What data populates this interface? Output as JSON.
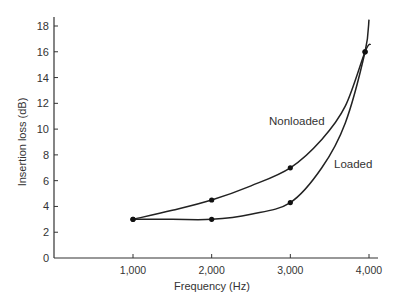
{
  "chart_data": {
    "type": "line",
    "title": "",
    "xlabel": "Frequency (Hz)",
    "ylabel": "Insertion loss (dB)",
    "xlim": [
      0,
      4200
    ],
    "ylim": [
      0,
      18.5
    ],
    "x_ticks": [
      1000,
      2000,
      3000,
      4000
    ],
    "x_tick_labels": [
      "1,000",
      "2,000",
      "3,000",
      "4,000"
    ],
    "y_ticks": [
      0,
      2,
      4,
      6,
      8,
      10,
      12,
      14,
      16,
      18
    ],
    "y_tick_labels": [
      "0",
      "2",
      "4",
      "6",
      "8",
      "10",
      "12",
      "14",
      "16",
      "18"
    ],
    "grid": false,
    "legend": "inline labels",
    "series": [
      {
        "name": "Nonloaded",
        "marked_points": [
          [
            1000,
            3
          ],
          [
            2000,
            4.5
          ],
          [
            3000,
            7
          ],
          [
            3950,
            16
          ]
        ],
        "curve": [
          [
            1000,
            3
          ],
          [
            1500,
            3.7
          ],
          [
            2000,
            4.5
          ],
          [
            2500,
            5.6
          ],
          [
            3000,
            7
          ],
          [
            3400,
            9.2
          ],
          [
            3700,
            11.8
          ],
          [
            3950,
            16
          ],
          [
            4020,
            16.6
          ]
        ]
      },
      {
        "name": "Loaded",
        "marked_points": [
          [
            1000,
            3
          ],
          [
            2000,
            3
          ],
          [
            3000,
            4.3
          ],
          [
            3950,
            16
          ]
        ],
        "curve": [
          [
            1000,
            3
          ],
          [
            1500,
            3
          ],
          [
            2000,
            3
          ],
          [
            2500,
            3.4
          ],
          [
            3000,
            4.3
          ],
          [
            3400,
            7
          ],
          [
            3700,
            10.5
          ],
          [
            3950,
            16
          ],
          [
            4000,
            18.5
          ]
        ]
      }
    ],
    "annotations": [
      "Nonloaded",
      "Loaded"
    ]
  }
}
